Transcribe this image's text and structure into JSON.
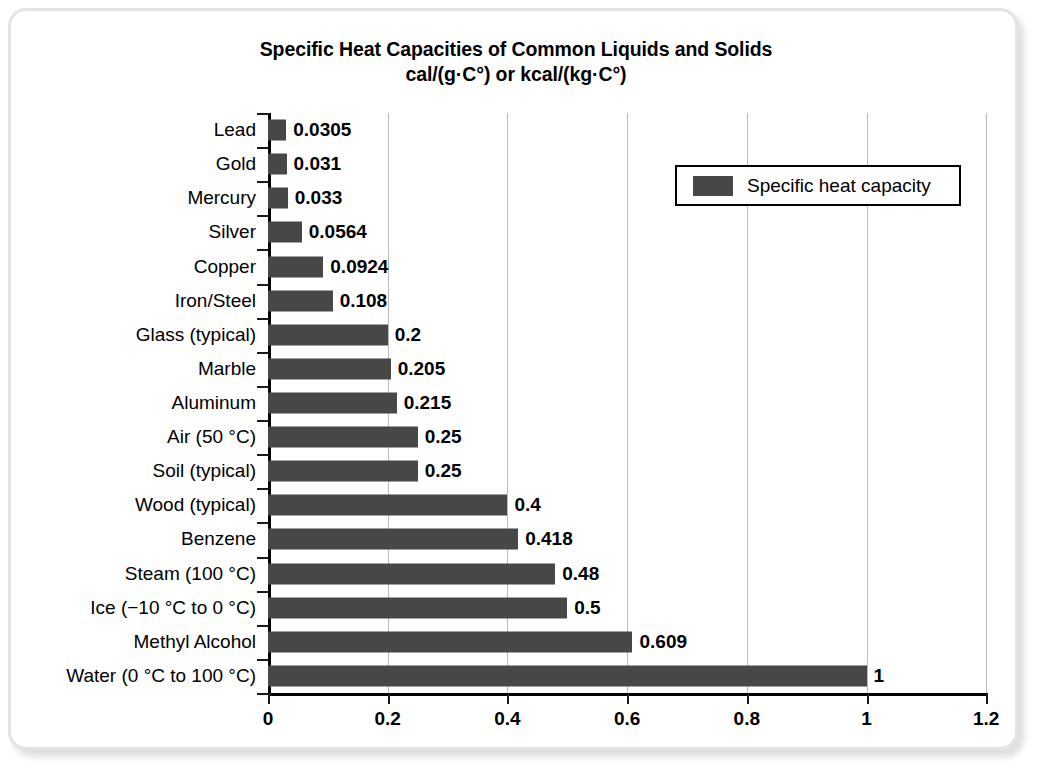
{
  "chart_data": {
    "type": "bar",
    "orientation": "horizontal",
    "title": "Specific Heat Capacities of Common Liquids and Solids",
    "subtitle": "cal/(g·C°) or kcal/(kg·C°)",
    "xlabel": "",
    "ylabel": "",
    "xlim": [
      0,
      1.2
    ],
    "xticks": [
      "0",
      "0.2",
      "0.4",
      "0.6",
      "0.8",
      "1",
      "1.2"
    ],
    "xtick_values": [
      0,
      0.2,
      0.4,
      0.6,
      0.8,
      1,
      1.2
    ],
    "grid": "vertical",
    "legend_position": "top-right",
    "legend": [
      "Specific heat capacity"
    ],
    "bar_color": "#474747",
    "categories": [
      "Lead",
      "Gold",
      "Mercury",
      "Silver",
      "Copper",
      "Iron/Steel",
      "Glass (typical)",
      "Marble",
      "Aluminum",
      "Air (50 °C)",
      "Soil (typical)",
      "Wood (typical)",
      "Benzene",
      "Steam (100 °C)",
      "Ice (−10 °C to 0 °C)",
      "Methyl Alcohol",
      "Water (0 °C to 100 °C)"
    ],
    "values": [
      0.0305,
      0.031,
      0.033,
      0.0564,
      0.0924,
      0.108,
      0.2,
      0.205,
      0.215,
      0.25,
      0.25,
      0.4,
      0.418,
      0.48,
      0.5,
      0.609,
      1
    ],
    "value_labels": [
      "0.0305",
      "0.031",
      "0.033",
      "0.0564",
      "0.0924",
      "0.108",
      "0.2",
      "0.205",
      "0.215",
      "0.25",
      "0.25",
      "0.4",
      "0.418",
      "0.48",
      "0.5",
      "0.609",
      "1"
    ],
    "series": [
      {
        "name": "Specific heat capacity",
        "values": [
          0.0305,
          0.031,
          0.033,
          0.0564,
          0.0924,
          0.108,
          0.2,
          0.205,
          0.215,
          0.25,
          0.25,
          0.4,
          0.418,
          0.48,
          0.5,
          0.609,
          1
        ]
      }
    ]
  }
}
